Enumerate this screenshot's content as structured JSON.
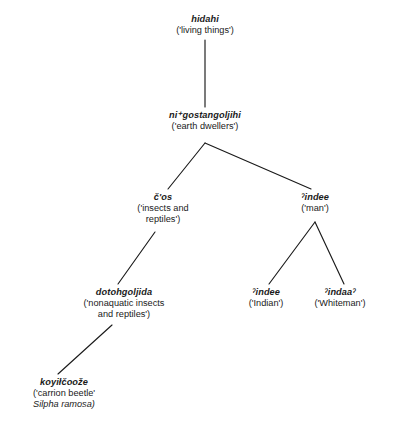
{
  "figure": {
    "type": "taxonomic-tree",
    "background_color": "#ffffff",
    "line_color": "#1a1a1a"
  },
  "nodes": {
    "root": {
      "term": "hidahi",
      "gloss": "('living things')"
    },
    "earth_dwellers": {
      "term": "ni⁺gostangoljihi",
      "gloss": "('earth dwellers')"
    },
    "insects_reptiles": {
      "term": "č'os",
      "gloss_line_1": "('insects and",
      "gloss_line_2": "reptiles')"
    },
    "man": {
      "term": "ˀindee",
      "gloss": "('man')"
    },
    "nonaquatic": {
      "term": "dotohgoljida",
      "gloss_line_1": "('nonaquatic insects",
      "gloss_line_2": "and reptiles')"
    },
    "indian": {
      "term": "ˀindee",
      "gloss": "('Indian')"
    },
    "whiteman": {
      "term": "ˀindaaˀ",
      "gloss": "('Whiteman')"
    },
    "carrion_beetle": {
      "term": "koyiłčoože",
      "gloss": "('carrion beetle'",
      "species": "Silpha ramosa)"
    }
  },
  "edges": [
    {
      "name": "root-to-earth-dwellers",
      "from": "root",
      "to": "earth_dwellers"
    },
    {
      "name": "earth-dwellers-to-insects",
      "from": "earth_dwellers",
      "to": "insects_reptiles"
    },
    {
      "name": "earth-dwellers-to-man",
      "from": "earth_dwellers",
      "to": "man"
    },
    {
      "name": "insects-to-nonaquatic",
      "from": "insects_reptiles",
      "to": "nonaquatic"
    },
    {
      "name": "nonaquatic-to-carrion-beetle",
      "from": "nonaquatic",
      "to": "carrion_beetle"
    },
    {
      "name": "man-to-indian",
      "from": "man",
      "to": "indian"
    },
    {
      "name": "man-to-whiteman",
      "from": "man",
      "to": "whiteman"
    }
  ]
}
